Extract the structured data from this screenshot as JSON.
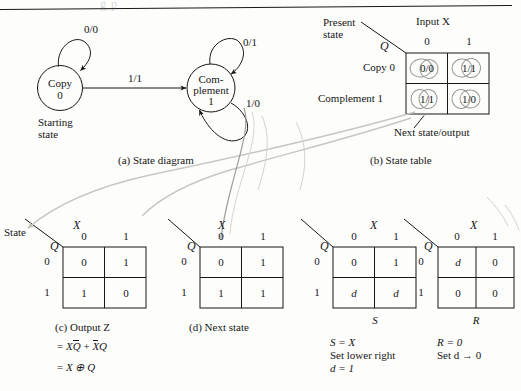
{
  "figure": {
    "clipped_header": "g                    p",
    "panels": {
      "a": "(a)  State diagram",
      "b": "(b)  State table",
      "c": "(c)  Output Z",
      "d": "(d)  Next state"
    }
  },
  "state_diagram": {
    "state0": {
      "name": "Copy",
      "code": "0"
    },
    "state1": {
      "name_line1": "Com-",
      "name_line2": "plement",
      "code": "1"
    },
    "start_label_line1": "Starting",
    "start_label_line2": "state",
    "transitions": [
      {
        "id": "self-loop-copy",
        "label": "0/0"
      },
      {
        "id": "copy-to-complement",
        "label": "1/1"
      },
      {
        "id": "self-loop-complement",
        "label": "0/1"
      },
      {
        "id": "complement-to-copy",
        "label": "1/0"
      }
    ]
  },
  "state_table": {
    "present_state_label_line1": "Present",
    "present_state_label_line2": "state",
    "q_symbol": "Q",
    "input_header": "Input X",
    "col_headers": [
      "0",
      "1"
    ],
    "row_labels": [
      "Copy 0",
      "Complement 1"
    ],
    "cells": [
      [
        "0/0",
        "1/1"
      ],
      [
        "1/1",
        "1/0"
      ]
    ],
    "footnote": "Next state/output"
  },
  "kmaps": [
    {
      "id": "output-z",
      "corner_left": "State",
      "corner_q": "Q",
      "top_var": "X",
      "col_headers": [
        "0",
        "1"
      ],
      "row_headers": [
        "0",
        "1"
      ],
      "cells": [
        [
          "0",
          "1"
        ],
        [
          "1",
          "0"
        ]
      ],
      "bottom_var": "",
      "caption": "(c)  Output Z",
      "notes": [
        "= XQ̄ + X̄Q",
        "= X ⊕ Q"
      ],
      "note_parts": [
        {
          "eq": "=",
          "a": "X",
          "a_bar": "Q",
          "plus": "+",
          "b_bar": "X",
          "b": "Q"
        },
        {
          "eq": "=",
          "expr": "X ⊕ Q"
        }
      ]
    },
    {
      "id": "next-state",
      "corner_left": "",
      "corner_q": "Q",
      "top_var": "X",
      "col_headers": [
        "0",
        "1"
      ],
      "row_headers": [
        "0",
        "1"
      ],
      "cells": [
        [
          "0",
          "1"
        ],
        [
          "1",
          "1"
        ]
      ],
      "bottom_var": "",
      "caption": "(d)  Next state",
      "notes": []
    },
    {
      "id": "set-input-s",
      "corner_left": "",
      "corner_q": "Q",
      "top_var": "X",
      "col_headers": [
        "0",
        "1"
      ],
      "row_headers": [
        "0",
        "1"
      ],
      "cells": [
        [
          "0",
          "1"
        ],
        [
          "d",
          "d"
        ]
      ],
      "bottom_var": "S",
      "caption": "",
      "notes": [
        "S = X",
        "Set lower right",
        "d = 1"
      ]
    },
    {
      "id": "reset-input-r",
      "corner_left": "",
      "corner_q": "Q",
      "top_var": "X",
      "col_headers": [
        "0",
        "1"
      ],
      "row_headers": [
        "0",
        "1"
      ],
      "cells": [
        [
          "d",
          "0"
        ],
        [
          "0",
          "0"
        ]
      ],
      "bottom_var": "R",
      "caption": "",
      "notes": [
        "R = 0",
        "Set d → 0"
      ]
    }
  ],
  "colors": {
    "ink": "#161616",
    "pencil_gray": "#b9b9b4",
    "paper": "#fdfdfc"
  }
}
